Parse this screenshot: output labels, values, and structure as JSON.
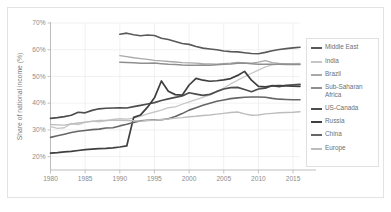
{
  "chart_data": {
    "type": "line",
    "title": "",
    "subtitle": "",
    "xlabel": "",
    "ylabel": "Share of national income (%)",
    "xlim": [
      1980,
      2016
    ],
    "ylim": [
      15,
      70
    ],
    "grid": true,
    "legend_position": "right",
    "x_ticks": [
      "1980",
      "1985",
      "1990",
      "1995",
      "2000",
      "2005",
      "2010",
      "2015"
    ],
    "x_tick_values": [
      1980,
      1985,
      1990,
      1995,
      2000,
      2005,
      2010,
      2015
    ],
    "y_ticks": [
      "20%",
      "30%",
      "40%",
      "50%",
      "60%",
      "70%"
    ],
    "y_tick_values": [
      20,
      30,
      40,
      50,
      60,
      70
    ],
    "series": [
      {
        "name": "Middle East",
        "color": "#595959",
        "width": 1.6,
        "x": [
          1990,
          1991,
          1992,
          1993,
          1994,
          1995,
          1996,
          1997,
          1998,
          1999,
          2000,
          2001,
          2002,
          2003,
          2004,
          2005,
          2006,
          2007,
          2008,
          2009,
          2010,
          2011,
          2012,
          2013,
          2014,
          2015,
          2016
        ],
        "values": [
          65.8,
          66.2,
          65.6,
          65.2,
          65.5,
          65.3,
          64.3,
          63.8,
          63.1,
          62.3,
          62.0,
          61.2,
          60.6,
          60.3,
          60.0,
          59.5,
          59.3,
          59.2,
          58.9,
          58.6,
          58.5,
          59.0,
          59.6,
          60.1,
          60.4,
          60.7,
          60.9
        ]
      },
      {
        "name": "India",
        "color": "#c6c6c6",
        "width": 1.3,
        "x": [
          1980,
          1981,
          1982,
          1983,
          1984,
          1985,
          1986,
          1987,
          1988,
          1989,
          1990,
          1991,
          1992,
          1993,
          1994,
          1995,
          1996,
          1997,
          1998,
          1999,
          2000,
          2001,
          2002,
          2003,
          2004,
          2005,
          2006,
          2007,
          2008,
          2009,
          2010,
          2011,
          2012,
          2013,
          2014,
          2015,
          2016
        ],
        "values": [
          31.2,
          30.6,
          30.8,
          32.4,
          32.0,
          32.8,
          33.3,
          33.0,
          33.5,
          33.9,
          34.2,
          34.0,
          34.4,
          35.2,
          36.0,
          36.7,
          37.4,
          38.3,
          38.6,
          39.6,
          40.5,
          41.3,
          42.2,
          43.1,
          44.2,
          45.7,
          47.2,
          48.6,
          49.9,
          51.2,
          52.4,
          53.6,
          54.3,
          54.6,
          54.7,
          54.8,
          54.9
        ]
      },
      {
        "name": "Brazil",
        "color": "#a9a9a9",
        "width": 1.3,
        "x": [
          1990,
          1991,
          1992,
          1993,
          1994,
          1995,
          1996,
          1997,
          1998,
          1999,
          2000,
          2001,
          2002,
          2003,
          2004,
          2005,
          2006,
          2007,
          2008,
          2009,
          2010,
          2011,
          2012,
          2013,
          2014,
          2015,
          2016
        ],
        "values": [
          57.8,
          57.4,
          57.0,
          56.7,
          56.4,
          56.0,
          55.8,
          55.6,
          55.4,
          55.2,
          55.1,
          55.0,
          54.8,
          54.7,
          54.6,
          54.8,
          55.0,
          55.3,
          55.1,
          55.0,
          55.4,
          55.9,
          55.2,
          54.9,
          54.8,
          54.7,
          54.7
        ]
      },
      {
        "name": "Sub-Saharan Africa",
        "color": "#8f8f8f",
        "width": 1.5,
        "x": [
          1990,
          1991,
          1992,
          1993,
          1994,
          1995,
          1996,
          1997,
          1998,
          1999,
          2000,
          2001,
          2002,
          2003,
          2004,
          2005,
          2006,
          2007,
          2008,
          2009,
          2010,
          2011,
          2012,
          2013,
          2014,
          2015,
          2016
        ],
        "values": [
          55.3,
          55.2,
          55.1,
          54.9,
          54.9,
          55.0,
          54.8,
          54.6,
          54.5,
          54.3,
          54.2,
          54.2,
          54.3,
          54.2,
          54.4,
          54.6,
          54.7,
          54.9,
          55.0,
          54.8,
          54.6,
          54.6,
          54.6,
          54.6,
          54.5,
          54.5,
          54.5
        ]
      },
      {
        "name": "US-Canada",
        "color": "#4d4d4d",
        "width": 1.7,
        "x": [
          1980,
          1981,
          1982,
          1983,
          1984,
          1985,
          1986,
          1987,
          1988,
          1989,
          1990,
          1991,
          1992,
          1993,
          1994,
          1995,
          1996,
          1997,
          1998,
          1999,
          2000,
          2001,
          2002,
          2003,
          2004,
          2005,
          2006,
          2007,
          2008,
          2009,
          2010,
          2011,
          2012,
          2013,
          2014,
          2015,
          2016
        ],
        "values": [
          34.3,
          34.6,
          35.0,
          35.5,
          36.6,
          36.4,
          37.3,
          37.9,
          38.1,
          38.2,
          38.3,
          38.2,
          38.7,
          39.2,
          39.7,
          40.2,
          41.0,
          41.6,
          42.2,
          42.7,
          43.9,
          43.4,
          42.9,
          43.3,
          44.4,
          45.3,
          45.8,
          45.9,
          45.1,
          44.3,
          45.3,
          45.6,
          46.6,
          46.2,
          46.7,
          46.9,
          47.0
        ]
      },
      {
        "name": "Russia",
        "color": "#3f3f3f",
        "width": 1.7,
        "x": [
          1980,
          1981,
          1982,
          1983,
          1984,
          1985,
          1986,
          1987,
          1988,
          1989,
          1990,
          1991,
          1992,
          1993,
          1994,
          1995,
          1996,
          1997,
          1998,
          1999,
          2000,
          2001,
          2002,
          2003,
          2004,
          2005,
          2006,
          2007,
          2008,
          2009,
          2010,
          2011,
          2012,
          2013,
          2014,
          2015,
          2016
        ],
        "values": [
          21.3,
          21.5,
          21.8,
          22.0,
          22.3,
          22.6,
          22.8,
          23.0,
          23.1,
          23.3,
          23.6,
          24.0,
          34.7,
          35.6,
          38.5,
          42.0,
          48.3,
          44.5,
          43.2,
          43.0,
          46.8,
          49.3,
          48.6,
          48.2,
          48.4,
          48.7,
          49.2,
          50.4,
          51.9,
          48.6,
          46.3,
          46.1,
          46.5,
          46.6,
          46.5,
          46.4,
          46.3
        ]
      },
      {
        "name": "China",
        "color": "#666666",
        "width": 1.6,
        "x": [
          1980,
          1981,
          1982,
          1983,
          1984,
          1985,
          1986,
          1987,
          1988,
          1989,
          1990,
          1991,
          1992,
          1993,
          1994,
          1995,
          1996,
          1997,
          1998,
          1999,
          2000,
          2001,
          2002,
          2003,
          2004,
          2005,
          2006,
          2007,
          2008,
          2009,
          2010,
          2011,
          2012,
          2013,
          2014,
          2015,
          2016
        ],
        "values": [
          27.2,
          27.8,
          28.4,
          29.0,
          29.5,
          29.8,
          30.1,
          30.3,
          30.7,
          30.8,
          31.5,
          32.1,
          32.8,
          33.4,
          33.6,
          33.7,
          33.8,
          34.2,
          35.0,
          36.1,
          37.4,
          38.3,
          39.2,
          40.0,
          40.7,
          41.2,
          41.7,
          42.0,
          42.2,
          42.3,
          42.3,
          42.2,
          41.8,
          41.5,
          41.4,
          41.3,
          41.3
        ]
      },
      {
        "name": "Europe",
        "color": "#bdbdbd",
        "width": 1.4,
        "x": [
          1980,
          1981,
          1982,
          1983,
          1984,
          1985,
          1986,
          1987,
          1988,
          1989,
          1990,
          1991,
          1992,
          1993,
          1994,
          1995,
          1996,
          1997,
          1998,
          1999,
          2000,
          2001,
          2002,
          2003,
          2004,
          2005,
          2006,
          2007,
          2008,
          2009,
          2010,
          2011,
          2012,
          2013,
          2014,
          2015,
          2016
        ],
        "values": [
          32.0,
          31.9,
          31.8,
          32.2,
          32.6,
          32.9,
          33.2,
          33.5,
          33.5,
          33.6,
          33.6,
          33.5,
          33.4,
          33.3,
          33.5,
          33.6,
          33.9,
          34.1,
          34.4,
          34.6,
          34.9,
          35.1,
          35.4,
          35.6,
          35.9,
          36.2,
          36.5,
          36.7,
          36.0,
          35.5,
          35.6,
          36.0,
          36.2,
          36.4,
          36.5,
          36.6,
          36.8
        ]
      }
    ]
  },
  "axes": {
    "y_title": "Share of national income (%)"
  },
  "legend": {
    "items": [
      {
        "label": "Middle East",
        "color": "#595959"
      },
      {
        "label": "India",
        "color": "#c6c6c6"
      },
      {
        "label": "Brazil",
        "color": "#a9a9a9"
      },
      {
        "label": "Sub-Saharan\nAfrica",
        "color": "#8f8f8f"
      },
      {
        "label": "US-Canada",
        "color": "#4d4d4d"
      },
      {
        "label": "Russia",
        "color": "#3f3f3f"
      },
      {
        "label": "China",
        "color": "#666666"
      },
      {
        "label": "Europe",
        "color": "#bdbdbd"
      }
    ]
  }
}
